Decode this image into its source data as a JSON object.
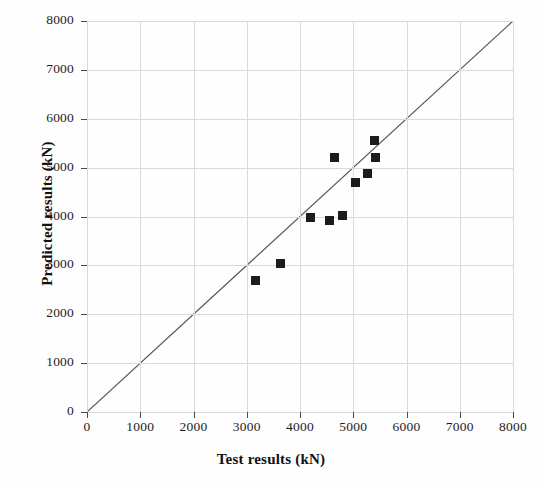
{
  "chart_data": {
    "type": "scatter",
    "title": "",
    "xlabel": "Test results (kN)",
    "ylabel": "Predicted results (kN)",
    "xlim": [
      0,
      8000
    ],
    "ylim": [
      0,
      8000
    ],
    "xticks": [
      0,
      1000,
      2000,
      3000,
      4000,
      5000,
      6000,
      7000,
      8000
    ],
    "yticks": [
      0,
      1000,
      2000,
      3000,
      4000,
      5000,
      6000,
      7000,
      8000
    ],
    "xtick_labels": [
      "0",
      "1000",
      "2000",
      "3000",
      "4000",
      "5000",
      "6000",
      "7000",
      "8000"
    ],
    "ytick_labels": [
      "0",
      "1000",
      "2000",
      "3000",
      "4000",
      "5000",
      "6000",
      "7000",
      "8000"
    ],
    "grid": true,
    "grid_color": "#d9d9d9",
    "legend": null,
    "marker_shape": "square",
    "marker_color": "#1c1c1c",
    "series": [
      {
        "name": "Predicted vs test",
        "points": [
          {
            "x": 3155,
            "y": 2700
          },
          {
            "x": 3643,
            "y": 3048
          },
          {
            "x": 4188,
            "y": 3970
          },
          {
            "x": 4563,
            "y": 3910
          },
          {
            "x": 4807,
            "y": 4030
          },
          {
            "x": 4657,
            "y": 5216
          },
          {
            "x": 5033,
            "y": 4690
          },
          {
            "x": 5259,
            "y": 4890
          },
          {
            "x": 5409,
            "y": 5200
          },
          {
            "x": 5390,
            "y": 5550
          }
        ]
      }
    ],
    "reference_line": {
      "name": "1:1 line",
      "from": {
        "x": 0,
        "y": 0
      },
      "to": {
        "x": 8000,
        "y": 8000
      },
      "color": "#55565a"
    }
  }
}
